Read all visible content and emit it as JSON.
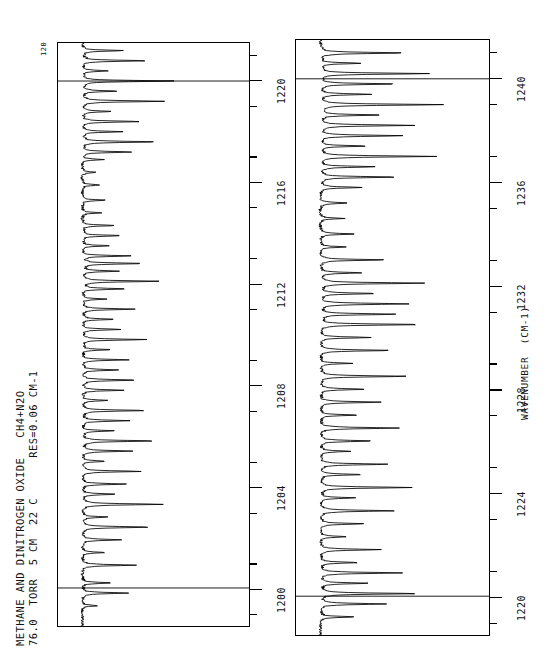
{
  "header": {
    "line1": "METHANE AND DINITROGEN OXIDE   CH4+N2O",
    "line2": "76.0  TORR  5 CM  22 C      RES=0.06 CM-1",
    "corner_label": "120"
  },
  "axis": {
    "title": "WAVENUMBER  (CM-1)",
    "top_ticks": [
      "1220",
      "1216",
      "1212",
      "1208",
      "1204",
      "1200"
    ],
    "bottom_ticks": [
      "1240",
      "1236",
      "1232",
      "1228",
      "1224",
      "1220"
    ]
  },
  "chart_data": {
    "type": "line",
    "title": "METHANE AND DINITROGEN OXIDE   CH4+N2O",
    "subtitle": "76.0  TORR  5 CM  22 C      RES=0.06 CM-1",
    "xlabel": "WAVENUMBER  (CM-1)",
    "ylabel": "TRANSMITTANCE",
    "orientation": "rotated-90",
    "grid": true,
    "legend": null,
    "panels": [
      {
        "name": "top-panel",
        "xlim": [
          1198.5,
          1221.5
        ],
        "ylim": [
          0,
          120
        ],
        "tick_values": [
          1200,
          1204,
          1208,
          1212,
          1216,
          1220
        ],
        "minor_tick_step": 2,
        "gridlines": [
          1200,
          1220
        ],
        "baseline": 4,
        "peaks": [
          {
            "x": 1199.3,
            "h": 12
          },
          {
            "x": 1199.8,
            "h": 34
          },
          {
            "x": 1200.2,
            "h": 22
          },
          {
            "x": 1200.9,
            "h": 40
          },
          {
            "x": 1201.4,
            "h": 17
          },
          {
            "x": 1201.9,
            "h": 30
          },
          {
            "x": 1202.4,
            "h": 52
          },
          {
            "x": 1202.8,
            "h": 20
          },
          {
            "x": 1203.3,
            "h": 61
          },
          {
            "x": 1203.7,
            "h": 26
          },
          {
            "x": 1204.1,
            "h": 33
          },
          {
            "x": 1204.6,
            "h": 44
          },
          {
            "x": 1205.0,
            "h": 18
          },
          {
            "x": 1205.4,
            "h": 38
          },
          {
            "x": 1205.8,
            "h": 55
          },
          {
            "x": 1206.2,
            "h": 24
          },
          {
            "x": 1206.6,
            "h": 36
          },
          {
            "x": 1207.0,
            "h": 47
          },
          {
            "x": 1207.4,
            "h": 20
          },
          {
            "x": 1207.8,
            "h": 31
          },
          {
            "x": 1208.2,
            "h": 42
          },
          {
            "x": 1208.6,
            "h": 28
          },
          {
            "x": 1209.0,
            "h": 35
          },
          {
            "x": 1209.4,
            "h": 22
          },
          {
            "x": 1209.8,
            "h": 48
          },
          {
            "x": 1210.2,
            "h": 30
          },
          {
            "x": 1210.6,
            "h": 26
          },
          {
            "x": 1211.0,
            "h": 40
          },
          {
            "x": 1211.4,
            "h": 19
          },
          {
            "x": 1211.8,
            "h": 33
          },
          {
            "x": 1212.1,
            "h": 58
          },
          {
            "x": 1212.5,
            "h": 27
          },
          {
            "x": 1212.8,
            "h": 46
          },
          {
            "x": 1213.1,
            "h": 36
          },
          {
            "x": 1213.5,
            "h": 21
          },
          {
            "x": 1213.9,
            "h": 30
          },
          {
            "x": 1214.3,
            "h": 25
          },
          {
            "x": 1214.8,
            "h": 15
          },
          {
            "x": 1215.3,
            "h": 18
          },
          {
            "x": 1215.9,
            "h": 13
          },
          {
            "x": 1216.4,
            "h": 11
          },
          {
            "x": 1216.9,
            "h": 16
          },
          {
            "x": 1217.2,
            "h": 38
          },
          {
            "x": 1217.6,
            "h": 56
          },
          {
            "x": 1218.0,
            "h": 30
          },
          {
            "x": 1218.4,
            "h": 44
          },
          {
            "x": 1218.8,
            "h": 21
          },
          {
            "x": 1219.2,
            "h": 62
          },
          {
            "x": 1219.6,
            "h": 26
          },
          {
            "x": 1220.0,
            "h": 70
          },
          {
            "x": 1220.4,
            "h": 19
          },
          {
            "x": 1220.8,
            "h": 48
          },
          {
            "x": 1221.2,
            "h": 30
          }
        ]
      },
      {
        "name": "bottom-panel",
        "xlim": [
          1218.5,
          1241.5
        ],
        "ylim": [
          0,
          120
        ],
        "tick_values": [
          1220,
          1224,
          1228,
          1232,
          1236,
          1240
        ],
        "minor_tick_step": 2,
        "gridlines": [
          1220,
          1240
        ],
        "baseline": 4,
        "peaks": [
          {
            "x": 1219.2,
            "h": 26
          },
          {
            "x": 1219.7,
            "h": 48
          },
          {
            "x": 1220.1,
            "h": 72
          },
          {
            "x": 1220.5,
            "h": 35
          },
          {
            "x": 1220.9,
            "h": 60
          },
          {
            "x": 1221.3,
            "h": 28
          },
          {
            "x": 1221.8,
            "h": 44
          },
          {
            "x": 1222.3,
            "h": 20
          },
          {
            "x": 1222.8,
            "h": 33
          },
          {
            "x": 1223.3,
            "h": 55
          },
          {
            "x": 1223.8,
            "h": 26
          },
          {
            "x": 1224.2,
            "h": 68
          },
          {
            "x": 1224.7,
            "h": 31
          },
          {
            "x": 1225.1,
            "h": 50
          },
          {
            "x": 1225.6,
            "h": 22
          },
          {
            "x": 1226.0,
            "h": 40
          },
          {
            "x": 1226.5,
            "h": 58
          },
          {
            "x": 1227.0,
            "h": 27
          },
          {
            "x": 1227.5,
            "h": 46
          },
          {
            "x": 1228.0,
            "h": 34
          },
          {
            "x": 1228.5,
            "h": 64
          },
          {
            "x": 1229.0,
            "h": 24
          },
          {
            "x": 1229.5,
            "h": 52
          },
          {
            "x": 1230.0,
            "h": 38
          },
          {
            "x": 1230.5,
            "h": 75
          },
          {
            "x": 1230.9,
            "h": 56
          },
          {
            "x": 1231.3,
            "h": 66
          },
          {
            "x": 1231.7,
            "h": 42
          },
          {
            "x": 1232.1,
            "h": 78
          },
          {
            "x": 1232.5,
            "h": 30
          },
          {
            "x": 1233.0,
            "h": 48
          },
          {
            "x": 1233.5,
            "h": 20
          },
          {
            "x": 1234.0,
            "h": 26
          },
          {
            "x": 1234.6,
            "h": 17
          },
          {
            "x": 1235.2,
            "h": 22
          },
          {
            "x": 1235.8,
            "h": 30
          },
          {
            "x": 1236.2,
            "h": 58
          },
          {
            "x": 1236.6,
            "h": 40
          },
          {
            "x": 1237.0,
            "h": 86
          },
          {
            "x": 1237.4,
            "h": 34
          },
          {
            "x": 1237.8,
            "h": 62
          },
          {
            "x": 1238.2,
            "h": 70
          },
          {
            "x": 1238.6,
            "h": 45
          },
          {
            "x": 1239.0,
            "h": 92
          },
          {
            "x": 1239.4,
            "h": 38
          },
          {
            "x": 1239.8,
            "h": 56
          },
          {
            "x": 1240.2,
            "h": 80
          },
          {
            "x": 1240.6,
            "h": 30
          },
          {
            "x": 1241.0,
            "h": 64
          }
        ]
      }
    ]
  }
}
